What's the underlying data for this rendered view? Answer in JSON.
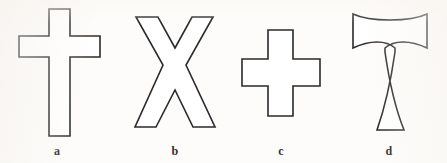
{
  "figure": {
    "background_color": "#fdfcfa",
    "stroke_color": "#2a2a2c",
    "fill_color": "#ffffff",
    "panels": [
      {
        "label": "a",
        "shape_name": "latin-cross",
        "label_x": 57,
        "label_y": 144,
        "path": "M 49 9 L 70 9 L 70 36 L 100 36 L 100 57 L 70 57 L 70 136 L 49 136 L 49 57 L 19 57 L 19 36 L 49 36 Z"
      },
      {
        "label": "b",
        "shape_name": "saltire-cross",
        "label_x": 175,
        "label_y": 144,
        "path": "M 136 17 L 158 17 L 175 48 L 192 17 L 213 17 L 186 65 L 215 127 L 193 127 L 175 90 L 156 127 L 135 127 L 163 65 Z"
      },
      {
        "label": "c",
        "shape_name": "greek-cross",
        "label_x": 281,
        "label_y": 144,
        "path": "M 268 30 L 293 30 L 293 59 L 320 59 L 320 86 L 293 86 L 293 116 L 268 116 L 268 86 L 242 86 L 242 59 L 268 59 Z"
      },
      {
        "label": "d",
        "shape_name": "tau-cross-flared",
        "label_x": 389,
        "label_y": 144,
        "path": "M 353 14 C 370 22 410 22 427 14 L 427 48 C 410 40 394 40 385 48 L 385 52 C 389 80 396 110 404 130 L 377 130 C 384 110 391 80 395 52 L 395 48 C 386 40 370 40 353 48 Z"
      }
    ]
  }
}
